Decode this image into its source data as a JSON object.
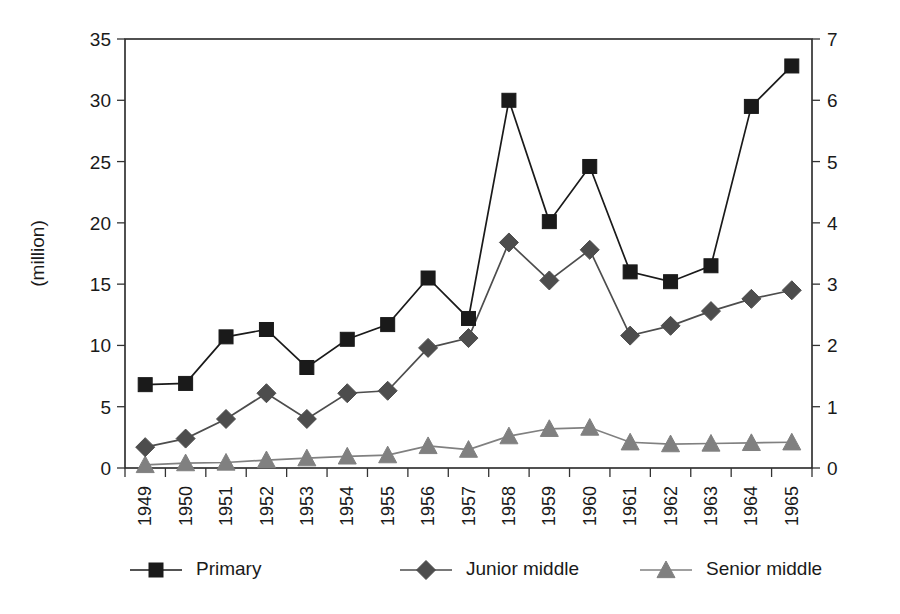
{
  "chart_data": {
    "type": "line",
    "title": "",
    "subtitle": "",
    "xlabel": "",
    "ylabel": "(million)",
    "y2label": "",
    "categories": [
      "1949",
      "1950",
      "1951",
      "1952",
      "1953",
      "1954",
      "1955",
      "1956",
      "1957",
      "1958",
      "1959",
      "1960",
      "1961",
      "1962",
      "1963",
      "1964",
      "1965"
    ],
    "x": [
      1949,
      1950,
      1951,
      1952,
      1953,
      1954,
      1955,
      1956,
      1957,
      1958,
      1959,
      1960,
      1961,
      1962,
      1963,
      1964,
      1965
    ],
    "ylim": [
      0,
      35
    ],
    "yticks": [
      0,
      5,
      10,
      15,
      20,
      25,
      30,
      35
    ],
    "y2lim": [
      0,
      7
    ],
    "y2ticks": [
      0,
      1,
      2,
      3,
      4,
      5,
      6,
      7
    ],
    "grid": false,
    "legend_position": "bottom",
    "series": [
      {
        "name": "Primary",
        "marker": "square",
        "color": "#1a1a1a",
        "axis": "left",
        "values": [
          6.8,
          6.9,
          10.7,
          11.3,
          8.2,
          10.5,
          11.7,
          15.5,
          12.2,
          30.0,
          20.1,
          24.6,
          16.0,
          15.2,
          16.5,
          29.5,
          32.8
        ]
      },
      {
        "name": "Junior middle",
        "marker": "diamond",
        "color": "#4d4d4d",
        "axis": "left",
        "values": [
          1.7,
          2.4,
          4.0,
          6.1,
          4.0,
          6.1,
          6.3,
          9.8,
          10.6,
          18.4,
          15.3,
          17.8,
          10.8,
          11.6,
          12.8,
          13.8,
          14.5
        ]
      },
      {
        "name": "Senior middle",
        "marker": "triangle",
        "color": "#808080",
        "axis": "left",
        "values": [
          0.25,
          0.4,
          0.45,
          0.65,
          0.8,
          0.95,
          1.05,
          1.8,
          1.5,
          2.6,
          3.2,
          3.3,
          2.1,
          1.95,
          2.0,
          2.05,
          2.1
        ]
      }
    ],
    "series_values_right_axis": {
      "note_axis_mapping": "left 0-35 corresponds to right 0-7"
    }
  },
  "axis": {
    "y_left_labels": [
      "35",
      "30",
      "25",
      "20",
      "15",
      "10",
      "5",
      "0"
    ],
    "y_right_labels": [
      "7",
      "6",
      "5",
      "4",
      "3",
      "2",
      "1",
      "0"
    ],
    "y_left_title": "(million)"
  },
  "legend": {
    "items": [
      {
        "label": "Primary",
        "marker": "square",
        "color": "#1a1a1a"
      },
      {
        "label": "Junior middle",
        "marker": "diamond",
        "color": "#4d4d4d"
      },
      {
        "label": "Senior middle",
        "marker": "triangle",
        "color": "#808080"
      }
    ]
  }
}
